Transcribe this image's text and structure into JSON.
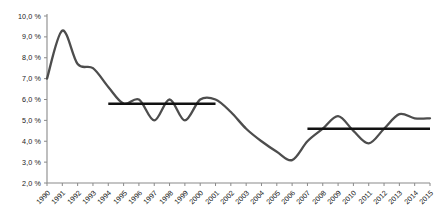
{
  "chart_data": {
    "type": "line",
    "title": "",
    "xlabel": "",
    "ylabel": "",
    "xlim": [
      1990,
      2015
    ],
    "ylim": [
      2.0,
      10.0
    ],
    "grid": false,
    "legend_position": "none",
    "y_tick_labels": [
      "10,0 %",
      "9,0 %",
      "8,0 %",
      "7,0 %",
      "6,0 %",
      "5,0 %",
      "4,0 %",
      "3,0 %",
      "2,0 %"
    ],
    "y_tick_values": [
      10.0,
      9.0,
      8.0,
      7.0,
      6.0,
      5.0,
      4.0,
      3.0,
      2.0
    ],
    "categories": [
      "1990",
      "1991",
      "1992",
      "1993",
      "1994",
      "1995",
      "1996",
      "1997",
      "1998",
      "1999",
      "2000",
      "2001",
      "2002",
      "2003",
      "2004",
      "2005",
      "2006",
      "2007",
      "2008",
      "2009",
      "2010",
      "2011",
      "2012",
      "2013",
      "2014",
      "2015"
    ],
    "x": [
      1990,
      1991,
      1992,
      1993,
      1994,
      1995,
      1996,
      1997,
      1998,
      1999,
      2000,
      2001,
      2002,
      2003,
      2004,
      2005,
      2006,
      2007,
      2008,
      2009,
      2010,
      2011,
      2012,
      2013,
      2014,
      2015
    ],
    "series": [
      {
        "name": "rate",
        "color": "#4d4d4d",
        "values": [
          7.0,
          9.3,
          7.7,
          7.5,
          6.6,
          5.8,
          6.0,
          5.0,
          6.0,
          5.0,
          6.0,
          6.0,
          5.4,
          4.6,
          4.0,
          3.5,
          3.1,
          4.0,
          4.6,
          5.2,
          4.5,
          3.9,
          4.6,
          5.3,
          5.1,
          5.1
        ]
      }
    ],
    "trend_lines": [
      {
        "name": "trend-1994-2001",
        "color": "#111111",
        "y": 5.8,
        "x_start": 1994,
        "x_end": 2001
      },
      {
        "name": "trend-2007-2015",
        "color": "#111111",
        "y": 4.6,
        "x_start": 2007,
        "x_end": 2015
      }
    ],
    "axis_color": "#8a8a8a"
  }
}
